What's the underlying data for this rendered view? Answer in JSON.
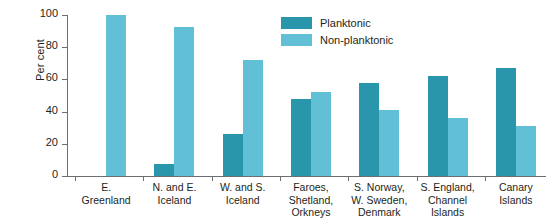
{
  "chart_data": {
    "type": "bar",
    "title": "",
    "xlabel": "",
    "ylabel": "Per cent",
    "ylim": [
      0,
      100
    ],
    "yticks": [
      0,
      20,
      40,
      60,
      80,
      100
    ],
    "grid": false,
    "legend_position": "top-center",
    "categories": [
      "E.\nGreenland",
      "N. and E.\nIceland",
      "W. and S.\nIceland",
      "Faroes,\nShetland,\nOrkneys",
      "S. Norway,\nW. Sweden,\nDenmark",
      "S. England,\nChannel\nIslands",
      "Canary\nIslands"
    ],
    "series": [
      {
        "name": "Planktonic",
        "color": "#2a96ab",
        "values": [
          0,
          7.5,
          26,
          48,
          58,
          62,
          67
        ]
      },
      {
        "name": "Non-planktonic",
        "color": "#62c0d6",
        "values": [
          100,
          92.5,
          72,
          52,
          41,
          36,
          31
        ]
      }
    ]
  },
  "axis": {
    "y_label": "Per cent",
    "y_tick_labels": [
      "0",
      "20",
      "40",
      "60",
      "80",
      "100"
    ]
  },
  "legend": {
    "items": [
      {
        "label": "Planktonic",
        "color": "#2a96ab"
      },
      {
        "label": "Non-planktonic",
        "color": "#62c0d6"
      }
    ]
  }
}
